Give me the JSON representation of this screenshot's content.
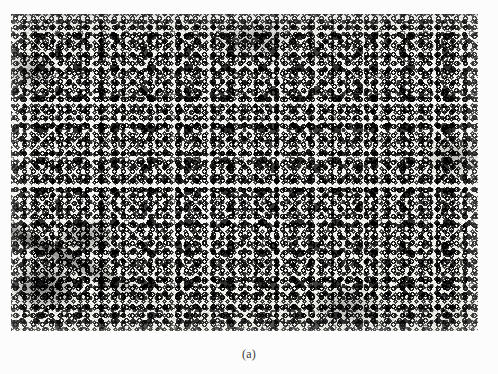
{
  "page": {
    "background_color": "#fcfcfc",
    "width": 498,
    "height": 374
  },
  "figure": {
    "caption": "(a)",
    "alt_description": "Black and white photomicrograph showing a dense dispersion of dark particles and ring-shaped (donut) features on a light matrix",
    "plate": {
      "left": 11,
      "top": 14,
      "width": 467,
      "height": 317,
      "border": "none",
      "colors": {
        "matrix_light": "#efefec",
        "particle_dark": "#0d0d0d",
        "mid_tone": "#7a7a78",
        "paper": "#fcfcfc"
      },
      "features": [
        "ring-shaped particles",
        "solid dark blobs",
        "halftone grain",
        "diagonal dark streak lower-left",
        "lighter matrix patches near centre",
        "thin scan line along top edge"
      ]
    }
  }
}
